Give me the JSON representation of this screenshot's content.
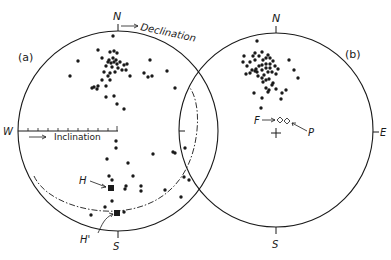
{
  "figure": {
    "panel_a": {
      "label": "(a)",
      "directions": {
        "N": "N",
        "S": "S",
        "W": "W"
      },
      "annotations": {
        "declination": "Declination",
        "inclination": "Inclination",
        "H": "H",
        "H_prime": "H'"
      }
    },
    "panel_b": {
      "label": "(b)",
      "directions": {
        "N": "N",
        "S": "S",
        "E": "E"
      },
      "annotations": {
        "F": "F",
        "P": "P"
      }
    },
    "colors": {
      "ink": "#1a1a1a",
      "background": "#ffffff"
    }
  },
  "chart_data": [
    {
      "type": "scatter",
      "title": "(a) Stereographic projection of directions",
      "projection": "equal-area stereonet",
      "axes": {
        "declination_arrow_from": "N",
        "inclination_scale_from": "W",
        "inclination_ticks": 10
      },
      "points_px": [
        [
          113,
          36
        ],
        [
          98,
          50
        ],
        [
          110,
          52
        ],
        [
          114,
          51
        ],
        [
          117,
          53
        ],
        [
          102,
          58
        ],
        [
          109,
          60
        ],
        [
          113,
          58
        ],
        [
          116,
          60
        ],
        [
          108,
          62
        ],
        [
          111,
          63
        ],
        [
          114,
          62
        ],
        [
          117,
          64
        ],
        [
          120,
          62
        ],
        [
          124,
          65
        ],
        [
          127,
          64
        ],
        [
          126,
          70
        ],
        [
          130,
          76
        ],
        [
          122,
          70
        ],
        [
          118,
          68
        ],
        [
          112,
          67
        ],
        [
          106,
          66
        ],
        [
          104,
          72
        ],
        [
          110,
          73
        ],
        [
          115,
          72
        ],
        [
          108,
          76
        ],
        [
          110,
          80
        ],
        [
          102,
          80
        ],
        [
          106,
          86
        ],
        [
          98,
          86
        ],
        [
          94,
          87
        ],
        [
          97,
          89
        ],
        [
          92,
          88
        ],
        [
          78,
          61
        ],
        [
          70,
          76
        ],
        [
          150,
          60
        ],
        [
          144,
          73
        ],
        [
          148,
          77
        ],
        [
          152,
          76
        ],
        [
          167,
          71
        ],
        [
          175,
          88
        ],
        [
          106,
          97
        ],
        [
          114,
          96
        ],
        [
          117,
          104
        ],
        [
          124,
          109
        ],
        [
          116,
          141
        ],
        [
          116,
          148
        ],
        [
          107,
          159
        ],
        [
          128,
          163
        ],
        [
          153,
          154
        ],
        [
          173,
          152
        ],
        [
          175,
          153
        ],
        [
          185,
          148
        ],
        [
          133,
          176
        ],
        [
          109,
          176
        ],
        [
          112,
          180
        ],
        [
          126,
          186
        ],
        [
          125,
          189
        ],
        [
          141,
          186
        ],
        [
          141,
          191
        ],
        [
          165,
          190
        ],
        [
          184,
          177
        ],
        [
          189,
          180
        ],
        [
          181,
          197
        ],
        [
          112,
          201
        ],
        [
          105,
          207
        ],
        [
          91,
          215
        ],
        [
          124,
          212
        ]
      ],
      "special_points": [
        {
          "label": "H",
          "marker": "square",
          "px": [
            111,
            188
          ]
        },
        {
          "label": "H'",
          "marker": "square",
          "px": [
            117,
            213
          ]
        }
      ],
      "small_circle_dashed": true
    },
    {
      "type": "scatter",
      "title": "(b) Stereographic projection of directions",
      "projection": "equal-area stereonet",
      "points_px": [
        [
          257,
          41
        ],
        [
          255,
          53
        ],
        [
          253,
          56
        ],
        [
          244,
          56
        ],
        [
          250,
          62
        ],
        [
          243,
          62
        ],
        [
          247,
          66
        ],
        [
          255,
          60
        ],
        [
          262,
          52
        ],
        [
          259,
          56
        ],
        [
          263,
          60
        ],
        [
          266,
          58
        ],
        [
          268,
          55
        ],
        [
          270,
          58
        ],
        [
          273,
          61
        ],
        [
          270,
          64
        ],
        [
          266,
          64
        ],
        [
          262,
          65
        ],
        [
          259,
          66
        ],
        [
          256,
          69
        ],
        [
          252,
          70
        ],
        [
          257,
          72
        ],
        [
          262,
          70
        ],
        [
          266,
          68
        ],
        [
          270,
          68
        ],
        [
          275,
          66
        ],
        [
          278,
          69
        ],
        [
          276,
          74
        ],
        [
          272,
          72
        ],
        [
          268,
          72
        ],
        [
          264,
          75
        ],
        [
          262,
          78
        ],
        [
          258,
          76
        ],
        [
          255,
          71
        ],
        [
          250,
          73
        ],
        [
          246,
          74
        ],
        [
          263,
          82
        ],
        [
          266,
          80
        ],
        [
          269,
          79
        ],
        [
          273,
          83
        ],
        [
          266,
          88
        ],
        [
          272,
          85
        ],
        [
          269,
          90
        ],
        [
          268,
          92
        ],
        [
          254,
          93
        ],
        [
          289,
          60
        ],
        [
          294,
          70
        ],
        [
          298,
          78
        ],
        [
          276,
          89
        ],
        [
          286,
          90
        ],
        [
          282,
          93
        ],
        [
          262,
          98
        ],
        [
          281,
          99
        ],
        [
          261,
          108
        ]
      ],
      "special_points": [
        {
          "label": "F",
          "marker": "open-diamond",
          "px": [
            280,
            120
          ]
        },
        {
          "label": "P",
          "marker": "open-diamond",
          "px": [
            287,
            121
          ]
        },
        {
          "label": "centre",
          "marker": "plus",
          "px": [
            276,
            132
          ]
        }
      ]
    }
  ]
}
